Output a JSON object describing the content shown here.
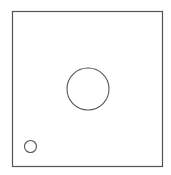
{
  "diagram": {
    "background": "#ffffff",
    "stroke_color": "#555555",
    "frame": {
      "x": 12.5,
      "y": 11.5,
      "width": 150,
      "height": 155
    },
    "shapes": [
      {
        "type": "circle",
        "name": "large-circle",
        "cx": 88,
        "cy": 89,
        "r": 21
      },
      {
        "type": "circle",
        "name": "small-circle",
        "cx": 30.5,
        "cy": 146.5,
        "r": 6
      }
    ]
  }
}
